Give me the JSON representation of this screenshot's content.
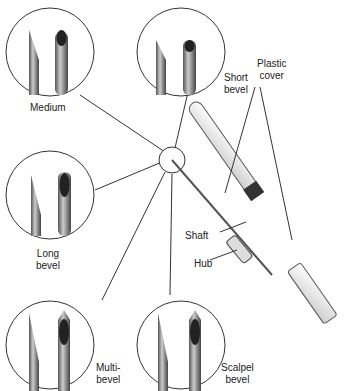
{
  "bevels": [
    {
      "id": "medium",
      "label_lines": [
        "Medium"
      ]
    },
    {
      "id": "short",
      "label_lines": [
        "Short",
        "bevel"
      ]
    },
    {
      "id": "long",
      "label_lines": [
        "Long",
        "bevel"
      ]
    },
    {
      "id": "multi",
      "label_lines": [
        "Multi-",
        "bevel"
      ]
    },
    {
      "id": "scalpel",
      "label_lines": [
        "Scalpel",
        "bevel"
      ]
    }
  ],
  "parts": {
    "plastic_cover": [
      "Plastic",
      "cover"
    ],
    "shaft": "Shaft",
    "hub": "Hub"
  }
}
